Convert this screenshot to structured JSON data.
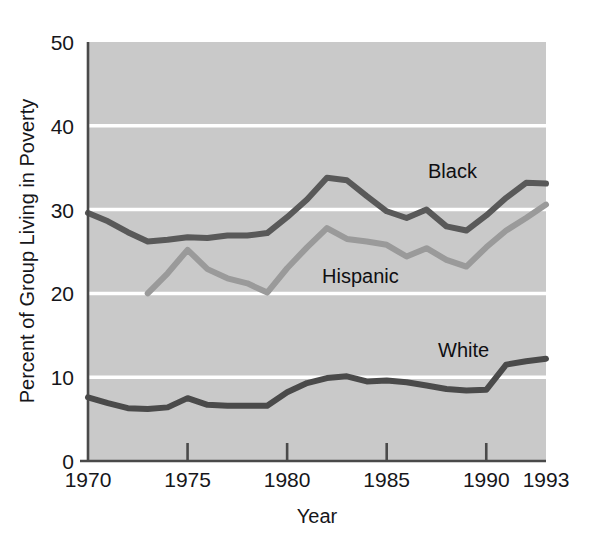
{
  "chart_data": {
    "type": "line",
    "title": "",
    "xlabel": "Year",
    "ylabel": "Percent of Group Living in Poverty",
    "xlim": [
      1970,
      1993
    ],
    "ylim": [
      0,
      50
    ],
    "xticks": [
      1970,
      1975,
      1980,
      1985,
      1990,
      1993
    ],
    "xtick_labels": [
      "1970",
      "1975",
      "1980",
      "1985",
      "1990",
      "1993"
    ],
    "yticks": [
      0,
      10,
      20,
      30,
      40,
      50
    ],
    "ytick_labels": [
      "0",
      "10",
      "20",
      "30",
      "40",
      "50"
    ],
    "gridlines": [
      "horizontal at 10, 20, 30, 40"
    ],
    "grid": true,
    "legend_position": "inline-labels",
    "plot_background": "#c9c9c9",
    "gridline_color": "#ffffff",
    "series": [
      {
        "name": "Black",
        "color": "#595959",
        "label_text": "Black",
        "x": [
          1970,
          1971,
          1972,
          1973,
          1974,
          1975,
          1976,
          1977,
          1978,
          1979,
          1980,
          1981,
          1982,
          1983,
          1984,
          1985,
          1986,
          1987,
          1988,
          1989,
          1990,
          1991,
          1992,
          1993
        ],
        "values": [
          29.6,
          28.6,
          27.3,
          26.2,
          26.4,
          26.7,
          26.6,
          26.9,
          26.9,
          27.2,
          29.1,
          31.2,
          33.8,
          33.5,
          31.6,
          29.8,
          29.0,
          30.0,
          28.0,
          27.5,
          29.3,
          31.4,
          33.2,
          33.1
        ]
      },
      {
        "name": "Hispanic",
        "color": "#9a9a9a",
        "label_text": "Hispanic",
        "x": [
          1973,
          1974,
          1975,
          1976,
          1977,
          1978,
          1979,
          1980,
          1981,
          1982,
          1983,
          1984,
          1985,
          1986,
          1987,
          1988,
          1989,
          1990,
          1991,
          1992,
          1993
        ],
        "values": [
          20.0,
          22.4,
          25.2,
          22.9,
          21.8,
          21.2,
          20.1,
          23.0,
          25.5,
          27.8,
          26.5,
          26.2,
          25.8,
          24.4,
          25.4,
          24.0,
          23.2,
          25.5,
          27.5,
          29.0,
          30.6
        ]
      },
      {
        "name": "White",
        "color": "#4a4a4a",
        "label_text": "White",
        "x": [
          1970,
          1971,
          1972,
          1973,
          1974,
          1975,
          1976,
          1977,
          1978,
          1979,
          1980,
          1981,
          1982,
          1983,
          1984,
          1985,
          1986,
          1987,
          1988,
          1989,
          1990,
          1991,
          1992,
          1993
        ],
        "values": [
          7.6,
          6.9,
          6.3,
          6.2,
          6.4,
          7.5,
          6.7,
          6.6,
          6.6,
          6.6,
          8.2,
          9.3,
          9.9,
          10.1,
          9.5,
          9.6,
          9.4,
          9.0,
          8.6,
          8.4,
          8.5,
          11.5,
          11.9,
          12.2
        ]
      }
    ]
  }
}
